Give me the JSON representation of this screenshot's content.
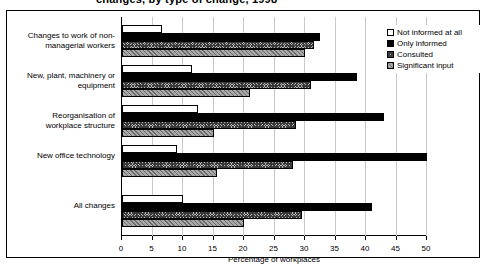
{
  "title": {
    "text": "changes, by type of change, 1998"
  },
  "legend": {
    "position": "top-right",
    "entries": [
      {
        "label": "Not informed at all",
        "pattern": "white-outline"
      },
      {
        "label": "Only informed",
        "pattern": "solid-black"
      },
      {
        "label": "Consulted",
        "pattern": "cross-hatch"
      },
      {
        "label": "Significant input",
        "pattern": "diagonal-hatch"
      }
    ]
  },
  "chart_data": {
    "type": "bar",
    "orientation": "horizontal",
    "title": "changes, by type of change, 1998",
    "xlabel": "Percentage of workplaces",
    "ylabel": "",
    "xlim": [
      0,
      50
    ],
    "xticks": [
      0,
      5,
      10,
      15,
      20,
      25,
      30,
      35,
      40,
      45,
      50
    ],
    "grid": true,
    "categories": [
      "Changes to work of non-managerial workers",
      "New, plant, machinery or equipment",
      "Reorganisation of workplace structure",
      "New office technology",
      "All changes"
    ],
    "category_labels": [
      "Changes to work of non-\nmanagerial workers",
      "New, plant, machinery or\nequipment",
      "Reorganisation of\nworkplace structure",
      "New office technology",
      "All changes"
    ],
    "series": [
      {
        "name": "Not informed at all",
        "values": [
          6.5,
          11.5,
          12.5,
          9,
          10
        ]
      },
      {
        "name": "Only informed",
        "values": [
          32.5,
          38.5,
          43,
          50,
          41
        ]
      },
      {
        "name": "Consulted",
        "values": [
          31.5,
          31,
          28.5,
          28,
          29.5
        ]
      },
      {
        "name": "Significant input",
        "values": [
          30,
          21,
          15,
          15.5,
          20
        ]
      }
    ]
  }
}
